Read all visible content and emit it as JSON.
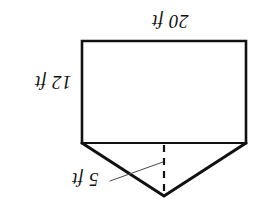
{
  "figure": {
    "orientation": "rotated-180",
    "background_color": "#ffffff",
    "stroke_color": "#111111",
    "labels": {
      "top": "20 ft",
      "left": "12 ft",
      "bottom": "5 ft"
    },
    "shape": {
      "rectangle": {
        "width_label": "20 ft",
        "height_label": "12 ft",
        "left": 82,
        "top": 41,
        "right": 246,
        "bottom": 143
      },
      "triangle": {
        "depth_label": "5 ft",
        "apex_x": 164,
        "apex_y": 196,
        "base_left_x": 82,
        "base_right_x": 246,
        "base_y": 143
      },
      "dashed_altitude": {
        "x": 164,
        "from_y": 143,
        "to_y": 196
      },
      "leader_line": {
        "from_x": 110,
        "from_y": 181,
        "to_x": 163,
        "to_y": 162
      }
    }
  }
}
